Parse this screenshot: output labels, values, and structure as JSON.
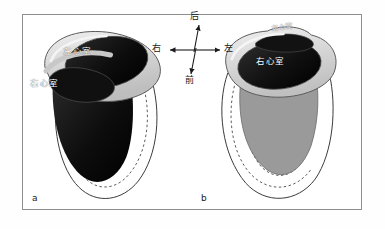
{
  "figure": {
    "panels": [
      {
        "letter": "a",
        "labels": {
          "left_ventricle": "左心室",
          "right_ventricle": "右心室"
        }
      },
      {
        "letter": "b",
        "labels": {
          "right_ventricle": "右心室",
          "left_ventricle": "左心室"
        }
      }
    ],
    "compass": {
      "posterior": "后",
      "anterior": "前",
      "right": "右",
      "left": "左"
    },
    "colors": {
      "frame_border": "#8e8e8e",
      "page_background": "#fefefe",
      "panel_background": "#ffffff",
      "myocardium_rim": "#d8d8d8",
      "cavity_dark": "#0d0d0d",
      "cavity_gray": "#9a9a9a",
      "outline": "#3a3a3a",
      "label_text": "#ffffff",
      "letter_text": "#202020"
    }
  }
}
